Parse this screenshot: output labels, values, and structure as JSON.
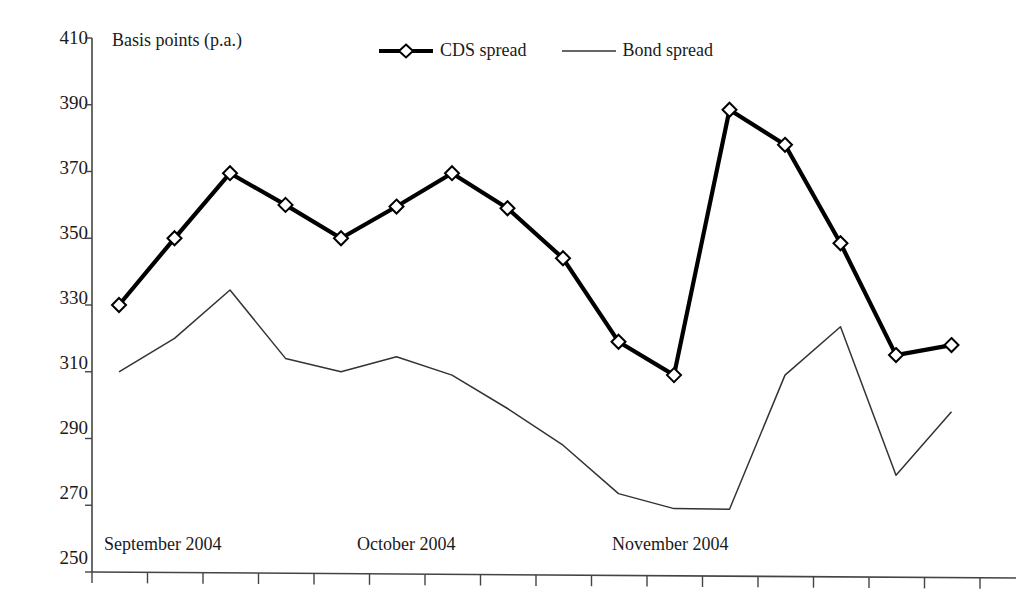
{
  "chart_data": {
    "type": "line",
    "title": "Basis points (p.a.)",
    "xlabel": "",
    "ylabel": "Basis points (p.a.)",
    "ylim": [
      250,
      410
    ],
    "ytick_step": 20,
    "yticks": [
      250,
      270,
      290,
      310,
      330,
      350,
      370,
      390,
      410
    ],
    "grid": false,
    "legend_position": "top-center",
    "x_group_labels": [
      "September 2004",
      "October 2004",
      "November 2004"
    ],
    "x_tick_count": 17,
    "series": [
      {
        "name": "CDS spread",
        "marker": "diamond-open",
        "line_width": "thick",
        "color": "#000000",
        "x_index": [
          0,
          1,
          2,
          3,
          4,
          5,
          6,
          7,
          8,
          9,
          10,
          11,
          12,
          13,
          14,
          15,
          16
        ],
        "values": [
          330,
          350,
          369.5,
          360,
          350,
          359.5,
          369.5,
          359,
          344,
          319,
          309,
          388.5,
          378,
          348.5,
          315,
          318,
          318
        ]
      },
      {
        "name": "Bond spread",
        "marker": "none",
        "line_width": "thin",
        "color": "#333333",
        "x_index": [
          0,
          1,
          2,
          3,
          4,
          5,
          6,
          7,
          8,
          9,
          10,
          11,
          12,
          13,
          14,
          15,
          16
        ],
        "values": [
          310,
          320,
          334.5,
          314,
          310,
          314.5,
          309,
          299,
          288,
          273.5,
          269,
          268.8,
          309,
          323.5,
          279,
          298,
          298
        ]
      }
    ]
  },
  "legend": {
    "entries": [
      {
        "label": "CDS spread",
        "key": "thick-line-diamond-marker"
      },
      {
        "label": "Bond spread",
        "key": "thin-line"
      }
    ]
  },
  "axes": {
    "y_title": "Basis points (p.a.)",
    "y_tick_labels": [
      "410",
      "390",
      "370",
      "350",
      "330",
      "310",
      "290",
      "270",
      "250"
    ],
    "x_tick_labels": [
      "September 2004",
      "October 2004",
      "November 2004"
    ]
  }
}
